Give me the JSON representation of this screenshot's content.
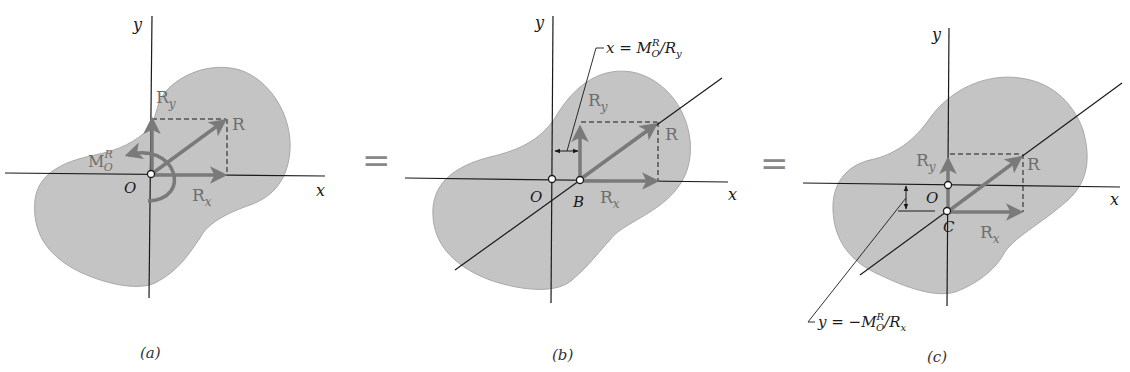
{
  "figure": {
    "colors": {
      "body_fill": "#c4c4c4",
      "body_stroke": "#a8a8a8",
      "vector": "#7a7a7a",
      "axis": "#1a1a1a",
      "equals": "#8a8a8a"
    },
    "equals_sign": "="
  },
  "panels": [
    {
      "id": "a",
      "caption": "(a)",
      "axis_x_label": "x",
      "axis_y_label": "y",
      "origin_label": "O",
      "vectors": {
        "resultant": "R",
        "x_component": "R",
        "x_sub": "x",
        "y_component": "R",
        "y_sub": "y",
        "moment": "M",
        "moment_sup": "R",
        "moment_sub": "O"
      }
    },
    {
      "id": "b",
      "caption": "(b)",
      "axis_x_label": "x",
      "axis_y_label": "y",
      "origin_label": "O",
      "point_label": "B",
      "vectors": {
        "resultant": "R",
        "x_component": "R",
        "x_sub": "x",
        "y_component": "R",
        "y_sub": "y"
      },
      "dimension": {
        "lhs": "x = M",
        "sup": "R",
        "sub": "O",
        "rhs": "/R",
        "rhs_sub": "y"
      }
    },
    {
      "id": "c",
      "caption": "(c)",
      "axis_x_label": "x",
      "axis_y_label": "y",
      "origin_label": "O",
      "point_label": "C",
      "vectors": {
        "resultant": "R",
        "x_component": "R",
        "x_sub": "x",
        "y_component": "R",
        "y_sub": "y"
      },
      "dimension": {
        "lhs": "y = −M",
        "sup": "R",
        "sub": "O",
        "rhs": "/R",
        "rhs_sub": "x"
      }
    }
  ]
}
